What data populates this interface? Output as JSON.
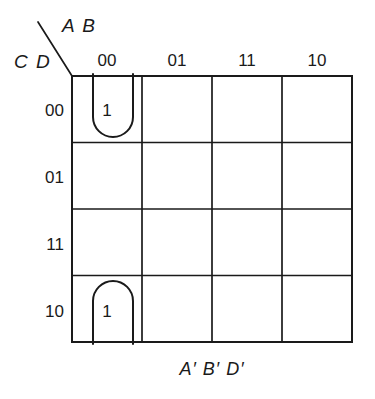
{
  "diagram": {
    "type": "karnaugh-map",
    "variables": 4,
    "caption": "A′ B′ D′",
    "axes": {
      "column_variables": "A B",
      "row_variables": "C D"
    },
    "column_headers": [
      "00",
      "01",
      "11",
      "10"
    ],
    "row_headers": [
      "00",
      "01",
      "11",
      "10"
    ],
    "cells": [
      {
        "row": "00",
        "col": "00",
        "value": "1"
      },
      {
        "row": "00",
        "col": "01",
        "value": ""
      },
      {
        "row": "00",
        "col": "11",
        "value": ""
      },
      {
        "row": "00",
        "col": "10",
        "value": ""
      },
      {
        "row": "01",
        "col": "00",
        "value": ""
      },
      {
        "row": "01",
        "col": "01",
        "value": ""
      },
      {
        "row": "01",
        "col": "11",
        "value": ""
      },
      {
        "row": "01",
        "col": "10",
        "value": ""
      },
      {
        "row": "11",
        "col": "00",
        "value": ""
      },
      {
        "row": "11",
        "col": "01",
        "value": ""
      },
      {
        "row": "11",
        "col": "11",
        "value": ""
      },
      {
        "row": "11",
        "col": "10",
        "value": ""
      },
      {
        "row": "10",
        "col": "00",
        "value": "1"
      },
      {
        "row": "10",
        "col": "01",
        "value": ""
      },
      {
        "row": "10",
        "col": "11",
        "value": ""
      },
      {
        "row": "10",
        "col": "10",
        "value": ""
      }
    ],
    "groupings": [
      {
        "name": "wrap-around-group-column-00",
        "term": "A′ B′ D′",
        "cells": [
          {
            "row": "00",
            "col": "00"
          },
          {
            "row": "10",
            "col": "00"
          }
        ],
        "style": "split-wrap-vertical"
      }
    ],
    "colors": {
      "grid_line": "#1a1a1a",
      "group_outline": "#1a1a1a",
      "text": "#1a1a1a",
      "background": "#ffffff"
    }
  }
}
